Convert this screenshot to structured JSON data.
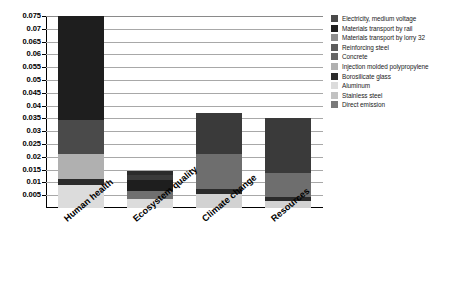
{
  "chart_data": {
    "type": "bar",
    "subtype": "stacked-bar",
    "title": "",
    "xlabel": "",
    "ylabel": "",
    "ylim": [
      0,
      0.075
    ],
    "ytick_values": [
      0.005,
      0.01,
      0.015,
      0.02,
      0.025,
      0.03,
      0.035,
      0.04,
      0.045,
      0.05,
      0.055,
      0.06,
      0.065,
      0.07,
      0.075
    ],
    "ytick_labels": [
      "0.005",
      "0.01",
      "0.015",
      "0.02",
      "0.025",
      "0.03",
      "0.035",
      "0.04",
      "0.045",
      "0.05",
      "0.055",
      "0.06",
      "0.065",
      "0.07",
      "0.075"
    ],
    "grid": true,
    "grid_axis": "y",
    "legend_position": "right",
    "categories": [
      "Human health",
      "Ecosystem quality",
      "Climate change",
      "Resources"
    ],
    "series": [
      {
        "name": "Electricity, medium voltage",
        "color": "#4a4a4a",
        "values": [
          0.0135,
          0.0019,
          0.0135,
          0.0095
        ]
      },
      {
        "name": "Materials transport by rail",
        "color": "#1e1e1e",
        "values": [
          0.0405,
          0.0016,
          0.0163,
          0.0213
        ]
      },
      {
        "name": "Materials transport by lorry 32",
        "color": "#8f8f8f",
        "values": [
          0.0,
          0.0,
          0.0,
          0.0
        ]
      },
      {
        "name": "Reinforcing steel",
        "color": "#5c5c5c",
        "values": [
          0.0,
          0.0,
          0.0,
          0.0
        ]
      },
      {
        "name": "Concrete",
        "color": "#666666",
        "values": [
          0.0,
          0.0,
          0.0,
          0.0
        ]
      },
      {
        "name": "Injection molded polypropylene",
        "color": "#b0b0b0",
        "values": [
          0.0095,
          0.0,
          0.0,
          0.0
        ]
      },
      {
        "name": "Borosilicate glass",
        "color": "#2b2b2b",
        "values": [
          0.0026,
          0.0042,
          0.0019,
          0.0017
        ]
      },
      {
        "name": "Aluminum",
        "color": "#dcdcdc",
        "values": [
          0.0089,
          0.0034,
          0.0056,
          0.0026
        ]
      },
      {
        "name": "Stainless steel",
        "color": "#c2c2c2",
        "values": [
          0.0,
          0.0034,
          0.0,
          0.0
        ]
      },
      {
        "name": "Direct emission",
        "color": "#7a7a7a",
        "values": [
          0.0,
          0.0,
          0.0,
          0.0
        ]
      }
    ],
    "bar_totals": [
      0.075,
      0.0145,
      0.0373,
      0.0351
    ],
    "stacks": [
      {
        "category": "Human health",
        "total": 0.075,
        "segments": [
          {
            "label": "Aluminum",
            "value": 0.0089,
            "color": "#dcdcdc"
          },
          {
            "label": "Borosilicate glass",
            "value": 0.0026,
            "color": "#2b2b2b"
          },
          {
            "label": "Injection molded polypropylene",
            "value": 0.0095,
            "color": "#b0b0b0"
          },
          {
            "label": "Electricity, medium voltage",
            "value": 0.0135,
            "color": "#4a4a4a"
          },
          {
            "label": "Materials transport by rail",
            "value": 0.0405,
            "color": "#1e1e1e"
          }
        ]
      },
      {
        "category": "Ecosystem quality",
        "total": 0.0145,
        "segments": [
          {
            "label": "Aluminum",
            "value": 0.0034,
            "color": "#dcdcdc"
          },
          {
            "label": "Stainless steel",
            "value": 0.0034,
            "color": "#707070"
          },
          {
            "label": "Borosilicate glass",
            "value": 0.0042,
            "color": "#1e1e1e"
          },
          {
            "label": "Electricity, medium voltage",
            "value": 0.0019,
            "color": "#3a3a3a"
          },
          {
            "label": "Materials transport by rail",
            "value": 0.0016,
            "color": "#2b2b2b"
          }
        ]
      },
      {
        "category": "Climate change",
        "total": 0.0373,
        "segments": [
          {
            "label": "Aluminum",
            "value": 0.0056,
            "color": "#d2d2d2"
          },
          {
            "label": "Borosilicate glass",
            "value": 0.0019,
            "color": "#2b2b2b"
          },
          {
            "label": "Electricity, medium voltage",
            "value": 0.0135,
            "color": "#6e6e6e"
          },
          {
            "label": "Materials transport by rail",
            "value": 0.0163,
            "color": "#3a3a3a"
          }
        ]
      },
      {
        "category": "Resources",
        "total": 0.0351,
        "segments": [
          {
            "label": "Aluminum",
            "value": 0.0026,
            "color": "#d2d2d2"
          },
          {
            "label": "Borosilicate glass",
            "value": 0.0017,
            "color": "#2b2b2b"
          },
          {
            "label": "Electricity, medium voltage",
            "value": 0.0095,
            "color": "#6e6e6e"
          },
          {
            "label": "Materials transport by rail",
            "value": 0.0213,
            "color": "#3a3a3a"
          }
        ]
      }
    ],
    "legend_entries": [
      {
        "label": "Electricity, medium voltage",
        "color": "#4a4a4a"
      },
      {
        "label": "Materials transport by rail",
        "color": "#1e1e1e"
      },
      {
        "label": "Materials transport by lorry 32",
        "color": "#8f8f8f"
      },
      {
        "label": "Reinforcing steel",
        "color": "#5c5c5c"
      },
      {
        "label": "Concrete",
        "color": "#666666"
      },
      {
        "label": "Injection molded polypropylene",
        "color": "#b0b0b0"
      },
      {
        "label": "Borosilicate glass",
        "color": "#2b2b2b"
      },
      {
        "label": "Aluminum",
        "color": "#dcdcdc"
      },
      {
        "label": "Stainless steel",
        "color": "#c2c2c2"
      },
      {
        "label": "Direct emission",
        "color": "#7a7a7a"
      }
    ]
  }
}
